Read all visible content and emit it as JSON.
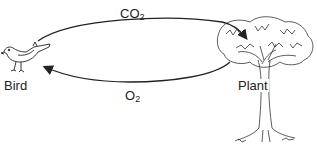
{
  "diagram": {
    "nodes": [
      {
        "id": "bird",
        "label": "Bird",
        "icon": "bird-icon"
      },
      {
        "id": "plant",
        "label": "Plant",
        "icon": "tree-icon"
      }
    ],
    "edges": [
      {
        "from": "bird",
        "to": "plant",
        "label_main": "CO",
        "label_sub": "2"
      },
      {
        "from": "plant",
        "to": "bird",
        "label_main": "O",
        "label_sub": "2"
      }
    ]
  }
}
